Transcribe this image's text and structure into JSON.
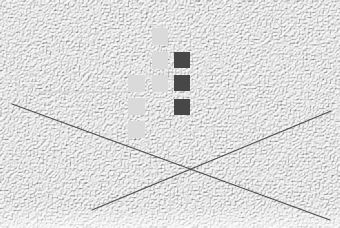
{
  "scene": {
    "width": 340,
    "height": 228,
    "background": {
      "base_color": "#ececec",
      "speckle_dark": "#9a9a9a",
      "speckle_light": "#ffffff",
      "description": "stucco-like noise texture"
    },
    "colors": {
      "light_square": "#dadada",
      "dark_square": "#474747",
      "line": "#505050",
      "faint_line": "#cfcfcf"
    },
    "light_squares": [
      {
        "x": 152,
        "y": 28,
        "w": 16,
        "h": 17
      },
      {
        "x": 152,
        "y": 52,
        "w": 16,
        "h": 17
      },
      {
        "x": 152,
        "y": 75,
        "w": 16,
        "h": 17
      },
      {
        "x": 128,
        "y": 75,
        "w": 17,
        "h": 17
      },
      {
        "x": 128,
        "y": 98,
        "w": 17,
        "h": 17
      },
      {
        "x": 128,
        "y": 121,
        "w": 17,
        "h": 17
      }
    ],
    "dark_squares": [
      {
        "x": 174,
        "y": 52,
        "w": 16,
        "h": 16
      },
      {
        "x": 174,
        "y": 75,
        "w": 16,
        "h": 16
      },
      {
        "x": 174,
        "y": 99,
        "w": 16,
        "h": 16
      }
    ],
    "lines": [
      {
        "name": "diagonal-line-descending",
        "x1": 12,
        "y1": 104,
        "x2": 330,
        "y2": 220,
        "width": 1.3
      },
      {
        "name": "diagonal-line-ascending",
        "x1": 92,
        "y1": 210,
        "x2": 331,
        "y2": 111,
        "width": 1.3
      }
    ],
    "faint_line": {
      "x1": 40,
      "y1": 92,
      "x2": 128,
      "y2": 92,
      "width": 1
    },
    "intersection": {
      "x": 191,
      "y": 170
    }
  }
}
